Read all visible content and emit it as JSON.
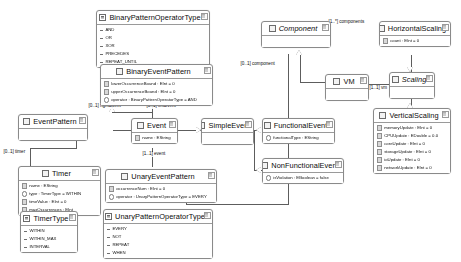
{
  "diagram": {
    "kind": "uml-class-diagram",
    "classes": [
      {
        "id": "binaryPatternOperatorType",
        "name": "BinaryPatternOperatorType",
        "stereotype": "enumeration",
        "abstract": false,
        "members": [
          "AND",
          "OR",
          "XOR",
          "PRECEDES",
          "REPEAT_UNTIL"
        ]
      },
      {
        "id": "binaryEventPattern",
        "name": "BinaryEventPattern",
        "stereotype": "class",
        "abstract": false,
        "members": [
          "lowerOccurrenceBound : EInt = 0",
          "upperOccurrenceBound : EInt = 0",
          "operator : BinaryPatternOperatorType = AND"
        ]
      },
      {
        "id": "eventPattern",
        "name": "EventPattern",
        "stereotype": "class",
        "abstract": false,
        "members": []
      },
      {
        "id": "event",
        "name": "Event",
        "stereotype": "class",
        "abstract": false,
        "members": [
          "name : EString"
        ]
      },
      {
        "id": "simpleEvent",
        "name": "SimpleEvent",
        "stereotype": "class",
        "abstract": false,
        "members": []
      },
      {
        "id": "timer",
        "name": "Timer",
        "stereotype": "class",
        "abstract": false,
        "members": [
          "name : EString",
          "type : TimerType = WITHIN",
          "timeValue : EInt = 0",
          "maxOccurrences : EInt"
        ]
      },
      {
        "id": "timerType",
        "name": "TimerType",
        "stereotype": "enumeration",
        "abstract": false,
        "members": [
          "WITHIN",
          "WITHIN_MAX",
          "INTERVAL"
        ]
      },
      {
        "id": "unaryEventPattern",
        "name": "UnaryEventPattern",
        "stereotype": "class",
        "abstract": false,
        "members": [
          "occurrenceNum : EInt = 0",
          "operator : UnaryPatternOperatorType = EVERY"
        ]
      },
      {
        "id": "unaryPatternOperatorType",
        "name": "UnaryPatternOperatorType",
        "stereotype": "enumeration",
        "abstract": false,
        "members": [
          "EVERY",
          "NOT",
          "REPEAT",
          "WHEN"
        ]
      },
      {
        "id": "component",
        "name": "Component",
        "stereotype": "class",
        "abstract": true,
        "members": []
      },
      {
        "id": "horizontalScaling",
        "name": "HorizontalScaling",
        "stereotype": "class",
        "abstract": false,
        "members": [
          "count : EInt = 0"
        ]
      },
      {
        "id": "vm",
        "name": "VM",
        "stereotype": "class",
        "abstract": false,
        "members": []
      },
      {
        "id": "scaling",
        "name": "Scaling",
        "stereotype": "class",
        "abstract": true,
        "members": []
      },
      {
        "id": "verticalScaling",
        "name": "VerticalScaling",
        "stereotype": "class",
        "abstract": false,
        "members": [
          "memoryUpdate : EInt = 0",
          "CPUUpdate : EDouble = 0.0",
          "coreUpdate : EInt = 0",
          "storageUpdate : EInt = 0",
          "ioUpdate : EInt = 0",
          "networkUpdate : EInt = 0"
        ]
      },
      {
        "id": "functionalEvent",
        "name": "FunctionalEvent",
        "stereotype": "class",
        "abstract": false,
        "members": [
          "functionalType : EString"
        ]
      },
      {
        "id": "nonFunctionalEvent",
        "name": "NonFunctionalEvent",
        "stereotype": "class",
        "abstract": false,
        "members": [
          "isViolation : EBoolean = false"
        ]
      }
    ],
    "edge_labels": [
      {
        "id": "rightEvent",
        "text": "[0..1] rightEvent"
      },
      {
        "id": "leftEvent",
        "text": "[0..1] leftEvent"
      },
      {
        "id": "timerRole",
        "text": "[0..1] timer"
      },
      {
        "id": "eventRole",
        "text": "[1..1] event"
      },
      {
        "id": "componentsRole",
        "text": "[1..*] components"
      },
      {
        "id": "componentRole",
        "text": "[0..1] component"
      },
      {
        "id": "vmRole",
        "text": "[1..1] vm"
      }
    ]
  }
}
